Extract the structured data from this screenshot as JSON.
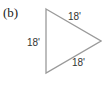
{
  "figure": {
    "part_label": "(b)",
    "shape": "equilateral-triangle",
    "stroke_color": "#9a9a9a",
    "sides": [
      {
        "position": "top-right",
        "label": "18'"
      },
      {
        "position": "left",
        "label": "18'"
      },
      {
        "position": "bottom-right",
        "label": "18'"
      }
    ]
  }
}
